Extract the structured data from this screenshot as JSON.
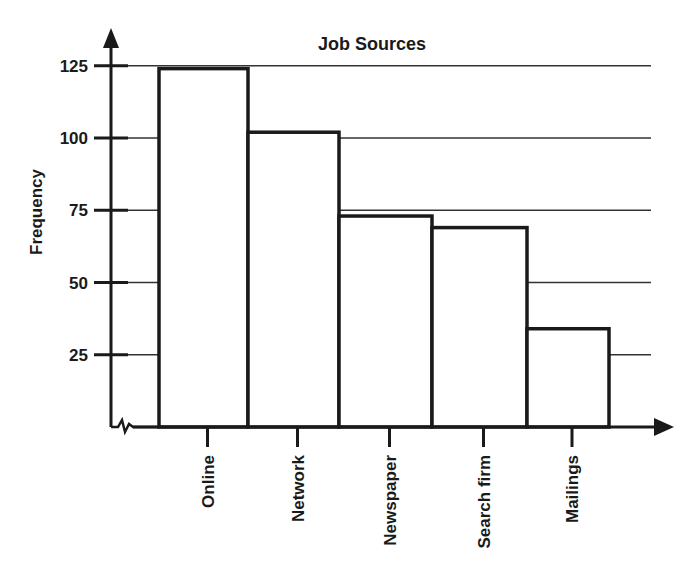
{
  "chart_data": {
    "type": "bar",
    "title": "Job Sources",
    "xlabel": "",
    "ylabel": "Frequency",
    "categories": [
      "Online",
      "Network",
      "Newspaper",
      "Search firm",
      "Mailings"
    ],
    "values": [
      124,
      102,
      73,
      69,
      34
    ],
    "ylim": [
      0,
      130
    ],
    "yticks": [
      25,
      50,
      75,
      100,
      125
    ],
    "grid": true,
    "legend": null,
    "bar_fill": "#ffffff",
    "bar_stroke": "#1a1a1a",
    "axis_break": true
  }
}
